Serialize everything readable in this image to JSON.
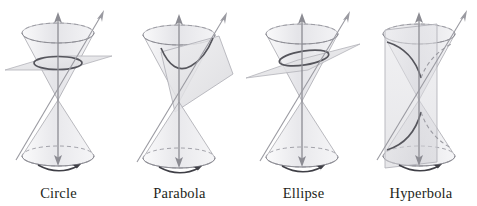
{
  "figure": {
    "background_color": "#ffffff",
    "label_color": "#231f20",
    "axis_color": "#8c8c93",
    "curve_color": "#4b4b52",
    "cone_fill": "#e9e9ec",
    "plane_fill": "#dcdcdf"
  },
  "panels": [
    {
      "id": "circle",
      "label": "Circle",
      "plane_orientation": "horizontal",
      "cut_curve": "circle",
      "nappes_cut": 1,
      "has_rotation_arrow": true,
      "has_axis_arrow": true,
      "has_generator_line": true
    },
    {
      "id": "parabola",
      "label": "Parabola",
      "plane_orientation": "tilted-parallel-to-generator",
      "cut_curve": "parabola",
      "nappes_cut": 1,
      "has_rotation_arrow": true,
      "has_axis_arrow": true,
      "has_generator_line": true
    },
    {
      "id": "ellipse",
      "label": "Ellipse",
      "plane_orientation": "slightly-tilted",
      "cut_curve": "ellipse",
      "nappes_cut": 1,
      "has_rotation_arrow": true,
      "has_axis_arrow": true,
      "has_generator_line": true
    },
    {
      "id": "hyperbola",
      "label": "Hyperbola",
      "plane_orientation": "vertical",
      "cut_curve": "hyperbola",
      "nappes_cut": 2,
      "has_rotation_arrow": true,
      "has_axis_arrow": true,
      "has_generator_line": true
    }
  ]
}
